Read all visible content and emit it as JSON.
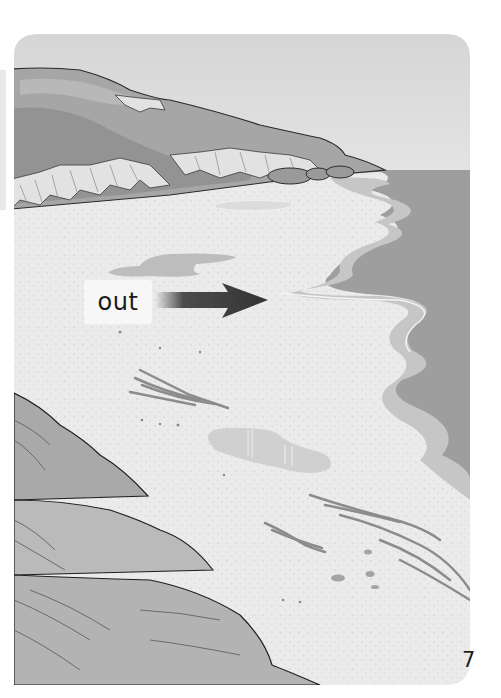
{
  "page": {
    "type": "illustrated book page",
    "page_number": "7"
  },
  "illustration": {
    "scene": "beach at low tide with cliffs, sea, tide pools and seaweed",
    "label": {
      "text": "out",
      "arrow_direction": "right",
      "arrow_points_to": "sea"
    },
    "elements": [
      "sky",
      "cliffs",
      "rocks",
      "sand",
      "sea",
      "tide-pools",
      "seaweed",
      "pebbles",
      "foreground-dunes"
    ]
  },
  "colors": {
    "sky": "#dcdcdc",
    "sea": "#9e9e9e",
    "shallow_water": "#c4c4c4",
    "sand": "#e9e9e9",
    "cliff_face": "#a4a4a4",
    "cliff_dark": "#8a8a8a",
    "cliff_light": "#d8d8d8",
    "arrow": "#3a3a3a",
    "seaweed": "#8c8c8c"
  }
}
